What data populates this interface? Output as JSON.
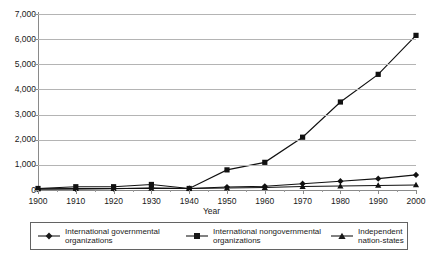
{
  "chart_data": {
    "type": "line",
    "title": "",
    "xlabel": "Year",
    "ylabel": "",
    "x": [
      1900,
      1910,
      1920,
      1930,
      1940,
      1950,
      1960,
      1970,
      1980,
      1990,
      2000
    ],
    "xtick_labels": [
      "1900",
      "1910",
      "1920",
      "1930",
      "1940",
      "1950",
      "1960",
      "1970",
      "1980",
      "1990",
      "2000"
    ],
    "ytick_labels": [
      "0",
      "1,000",
      "2,000",
      "3,000",
      "4,000",
      "5,000",
      "6,000",
      "7,000"
    ],
    "ytick_values": [
      0,
      1000,
      2000,
      3000,
      4000,
      5000,
      6000,
      7000
    ],
    "ylim": [
      0,
      7000
    ],
    "xlim": [
      1900,
      2000
    ],
    "grid": "horizontal",
    "legend_position": "bottom",
    "series": [
      {
        "name": "International governmental organizations",
        "marker": "diamond",
        "values": [
          30,
          40,
          50,
          80,
          60,
          120,
          150,
          250,
          350,
          450,
          600
        ]
      },
      {
        "name": "International nongovernmental organizations",
        "marker": "square",
        "values": [
          60,
          130,
          130,
          220,
          60,
          800,
          1100,
          2100,
          3500,
          4600,
          6150
        ]
      },
      {
        "name": "Independent nation-states",
        "marker": "triangle",
        "values": [
          50,
          55,
          60,
          65,
          60,
          80,
          100,
          140,
          160,
          180,
          200
        ]
      }
    ]
  },
  "axis": {
    "x_title": "Year"
  },
  "legend": {
    "entries": [
      {
        "label": "International governmental organizations",
        "marker_icon": "diamond-marker-icon"
      },
      {
        "label": "International nongovernmental organizations",
        "marker_icon": "square-marker-icon"
      },
      {
        "label": "Independent nation-states",
        "marker_icon": "triangle-marker-icon"
      }
    ]
  }
}
